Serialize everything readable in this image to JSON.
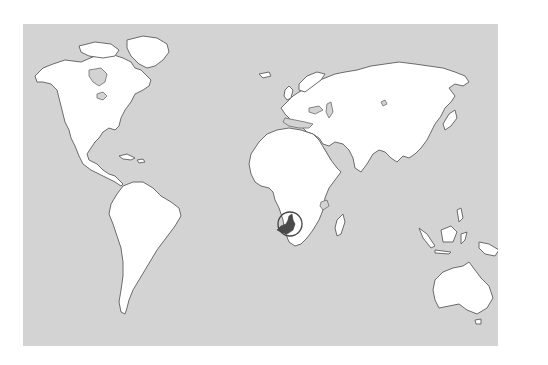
{
  "map": {
    "type": "world-locator-map",
    "highlighted_country": "Cameroon",
    "highlighted_region": "Central Africa",
    "colors": {
      "ocean": "#d3d3d3",
      "land": "#ffffff",
      "coastline": "#6b6b6b",
      "highlight": "#4a4a4a",
      "locator_circle": "#444444",
      "page_background": "#ffffff"
    },
    "locator_circle": {
      "cx": 267,
      "cy": 203,
      "r": 12
    },
    "continents": [
      "North America",
      "Greenland",
      "South America",
      "Europe",
      "Asia",
      "Africa",
      "Madagascar",
      "Australia",
      "New Zealand",
      "Indonesia",
      "Japan",
      "United Kingdom"
    ]
  }
}
